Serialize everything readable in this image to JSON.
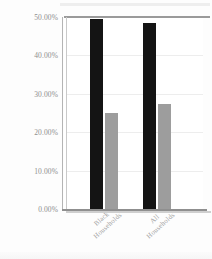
{
  "chart_data": {
    "type": "bar",
    "title": "",
    "subtitle": "",
    "xlabel": "",
    "ylabel": "",
    "categories": [
      "Black Households",
      "All Households"
    ],
    "category_lines": [
      [
        "Black",
        "Households"
      ],
      [
        "All",
        "Households"
      ]
    ],
    "series": [
      {
        "name": "series-1",
        "color": "#141414",
        "values": [
          49.5,
          48.5
        ]
      },
      {
        "name": "series-2",
        "color": "#9d9d9d",
        "values": [
          25.0,
          27.3
        ]
      }
    ],
    "ylim": [
      0,
      50
    ],
    "ytick_values": [
      50,
      40,
      30,
      20,
      10,
      0
    ],
    "ytick_labels": [
      "50.00%",
      "40.00%",
      "30.00%",
      "20.00%",
      "10.00%",
      "0.00%"
    ],
    "grid": true,
    "grid_axis": "y",
    "legend": false,
    "legend_position": "none",
    "annotations": []
  },
  "colors": {
    "series_black": "#141414",
    "series_gray": "#9d9d9d",
    "axis": "#8f8f8f",
    "gridline": "#ededed",
    "tick_text": "#8e8e8e",
    "label_text": "#a2a2a2",
    "plot_background": "#ffffff",
    "page_background": "#fdfdfd"
  }
}
